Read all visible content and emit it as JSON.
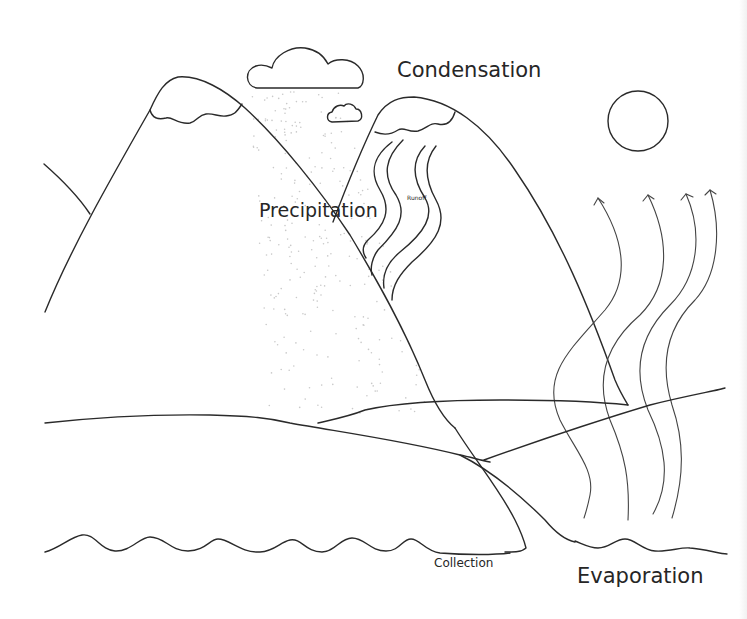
{
  "diagram": {
    "labels": {
      "condensation": "Condensation",
      "precipitation": "Precipitation",
      "runoff": "Runoff",
      "collection": "Collection",
      "evaporation": "Evaporation"
    },
    "elements": [
      {
        "name": "sun",
        "shape": "circle"
      },
      {
        "name": "rain-cloud",
        "shape": "cloud"
      },
      {
        "name": "small-cloud",
        "shape": "cloud"
      },
      {
        "name": "left-mountain",
        "shape": "peak-with-snowcap"
      },
      {
        "name": "right-mountain",
        "shape": "peak-with-snowcap"
      },
      {
        "name": "runoff-streams",
        "count": 4
      },
      {
        "name": "evaporation-arrows",
        "count": 4
      },
      {
        "name": "rolling-hills",
        "count": 3
      },
      {
        "name": "water-waves",
        "count": 2
      }
    ],
    "colors": {
      "line": "#2a2a2a",
      "background": "#ffffff",
      "rain_dots": "#c9c9c9"
    }
  }
}
